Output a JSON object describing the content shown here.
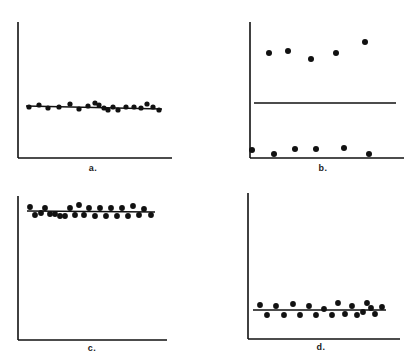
{
  "figure": {
    "title": "",
    "background_color": "#ffffff",
    "ink_color": "#111111",
    "width": 409,
    "height": 364,
    "panel_count": 4
  },
  "panels": [
    {
      "id": "a",
      "label": "a.",
      "origin_x": 0,
      "origin_y": 0,
      "axis": {
        "x_axis_y": 158,
        "y_axis_x": 18,
        "x_axis_x_start": 18,
        "x_axis_x_end": 172,
        "y_axis_y_start": 22,
        "y_axis_y_end": 158
      },
      "line": {
        "x1": 26,
        "y1": 106,
        "x2": 162,
        "y2": 109
      },
      "point_radius": 2.6
    },
    {
      "id": "b",
      "label": "b.",
      "origin_x": 205,
      "origin_y": 0,
      "axis": {
        "x_axis_y": 158,
        "y_axis_x": 45,
        "x_axis_x_start": 45,
        "x_axis_x_end": 199,
        "y_axis_y_start": 22,
        "y_axis_y_end": 158
      },
      "line": {
        "x1": 49,
        "y1": 103,
        "x2": 191,
        "y2": 103
      },
      "point_radius": 3.0
    },
    {
      "id": "c",
      "label": "c.",
      "origin_x": 0,
      "origin_y": 182,
      "axis": {
        "x_axis_y": 158,
        "y_axis_x": 18,
        "x_axis_x_start": 18,
        "x_axis_x_end": 167,
        "y_axis_y_start": 14,
        "y_axis_y_end": 158
      },
      "line": {
        "x1": 27,
        "y1": 29,
        "x2": 155,
        "y2": 30
      },
      "point_radius": 2.9
    },
    {
      "id": "d",
      "label": "d.",
      "origin_x": 205,
      "origin_y": 182,
      "axis": {
        "x_axis_y": 157,
        "y_axis_x": 43,
        "x_axis_x_start": 43,
        "x_axis_x_end": 195,
        "y_axis_y_start": 11,
        "y_axis_y_end": 157
      },
      "line": {
        "x1": 48,
        "y1": 128,
        "x2": 181,
        "y2": 128
      },
      "point_radius": 2.9
    }
  ],
  "chart_data": {
    "type": "scatter",
    "xlabel": "",
    "ylabel": "",
    "grid": false,
    "legend": false,
    "note": "Pixel coordinates are measured within each panel's local 204x182 box; y increases downward.",
    "series": [
      {
        "name": "a",
        "panel": "a",
        "description": "Residuals scattered tightly and randomly about a nearly flat fitted line spanning the middle of the panel.",
        "fit_line": {
          "x1": 26,
          "y1": 106,
          "x2": 162,
          "y2": 109
        },
        "points": [
          {
            "x": 29,
            "y": 107
          },
          {
            "x": 39,
            "y": 105
          },
          {
            "x": 48,
            "y": 108
          },
          {
            "x": 59,
            "y": 107
          },
          {
            "x": 70,
            "y": 104
          },
          {
            "x": 79,
            "y": 109
          },
          {
            "x": 88,
            "y": 106
          },
          {
            "x": 95,
            "y": 103
          },
          {
            "x": 99,
            "y": 105
          },
          {
            "x": 104,
            "y": 108
          },
          {
            "x": 108,
            "y": 110
          },
          {
            "x": 113,
            "y": 107
          },
          {
            "x": 118,
            "y": 110
          },
          {
            "x": 126,
            "y": 107
          },
          {
            "x": 134,
            "y": 107
          },
          {
            "x": 141,
            "y": 108
          },
          {
            "x": 147,
            "y": 104
          },
          {
            "x": 153,
            "y": 107
          },
          {
            "x": 159,
            "y": 110
          }
        ]
      },
      {
        "name": "b",
        "panel": "b",
        "description": "Residuals split into two distant clusters, six well above and six well below the fitted line; strong lack-of-fit pattern.",
        "fit_line": {
          "x1": 49,
          "y1": 103,
          "x2": 191,
          "y2": 103
        },
        "points": [
          {
            "x": 64,
            "y": 53
          },
          {
            "x": 83,
            "y": 51
          },
          {
            "x": 106,
            "y": 59
          },
          {
            "x": 131,
            "y": 53
          },
          {
            "x": 160,
            "y": 42
          },
          {
            "x": 47,
            "y": 150
          },
          {
            "x": 69,
            "y": 154
          },
          {
            "x": 90,
            "y": 149
          },
          {
            "x": 111,
            "y": 149
          },
          {
            "x": 139,
            "y": 148
          },
          {
            "x": 164,
            "y": 154
          }
        ]
      },
      {
        "name": "c",
        "panel": "c",
        "description": "Dense band of residuals alternating above and below a flat fitted line near the top of the panel.",
        "fit_line": {
          "x1": 27,
          "y1": 29,
          "x2": 155,
          "y2": 30
        },
        "points": [
          {
            "x": 30,
            "y": 25
          },
          {
            "x": 35,
            "y": 33
          },
          {
            "x": 41,
            "y": 31
          },
          {
            "x": 45,
            "y": 26
          },
          {
            "x": 50,
            "y": 32
          },
          {
            "x": 55,
            "y": 32
          },
          {
            "x": 60,
            "y": 34
          },
          {
            "x": 65,
            "y": 34
          },
          {
            "x": 70,
            "y": 26
          },
          {
            "x": 75,
            "y": 33
          },
          {
            "x": 79,
            "y": 23
          },
          {
            "x": 84,
            "y": 33
          },
          {
            "x": 89,
            "y": 26
          },
          {
            "x": 95,
            "y": 34
          },
          {
            "x": 100,
            "y": 26
          },
          {
            "x": 106,
            "y": 34
          },
          {
            "x": 111,
            "y": 26
          },
          {
            "x": 117,
            "y": 34
          },
          {
            "x": 122,
            "y": 26
          },
          {
            "x": 128,
            "y": 34
          },
          {
            "x": 133,
            "y": 24
          },
          {
            "x": 139,
            "y": 33
          },
          {
            "x": 144,
            "y": 27
          },
          {
            "x": 151,
            "y": 33
          }
        ]
      },
      {
        "name": "d",
        "panel": "d",
        "description": "Band of residuals alternating above and below a flat fitted line positioned low in the panel.",
        "fit_line": {
          "x1": 48,
          "y1": 128,
          "x2": 181,
          "y2": 128
        },
        "points": [
          {
            "x": 55,
            "y": 123
          },
          {
            "x": 62,
            "y": 133
          },
          {
            "x": 71,
            "y": 124
          },
          {
            "x": 79,
            "y": 133
          },
          {
            "x": 88,
            "y": 122
          },
          {
            "x": 95,
            "y": 133
          },
          {
            "x": 104,
            "y": 124
          },
          {
            "x": 111,
            "y": 133
          },
          {
            "x": 119,
            "y": 127
          },
          {
            "x": 127,
            "y": 133
          },
          {
            "x": 133,
            "y": 121
          },
          {
            "x": 140,
            "y": 132
          },
          {
            "x": 147,
            "y": 124
          },
          {
            "x": 152,
            "y": 133
          },
          {
            "x": 158,
            "y": 130
          },
          {
            "x": 162,
            "y": 121
          },
          {
            "x": 166,
            "y": 126
          },
          {
            "x": 170,
            "y": 132
          },
          {
            "x": 177,
            "y": 125
          }
        ]
      }
    ]
  }
}
